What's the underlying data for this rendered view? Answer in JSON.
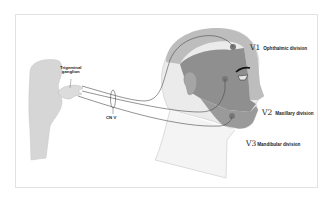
{
  "diagram": {
    "labels": {
      "ganglion_line1": "Trigeminal",
      "ganglion_line2": "ganglion",
      "nerve": "CN V",
      "v1_num": "V1",
      "v1_name": "Ophthalmic division",
      "v2_num": "V2",
      "v2_name": "Maxillary division",
      "v3_num": "V3",
      "v3_name": "Mandibular division"
    },
    "colors": {
      "background": "#ffffff",
      "frame_border": "#e2e2e2",
      "brainstem": "#d4d4d4",
      "ganglion": "#dcdcdc",
      "v1_region": "#bdbdbd",
      "v2_region": "#8f8f8f",
      "v3_region": "#9a9a9a",
      "neck_outline": "#c8c8c8",
      "nerve_line": "#4a4a4a",
      "text": "#222222"
    }
  }
}
